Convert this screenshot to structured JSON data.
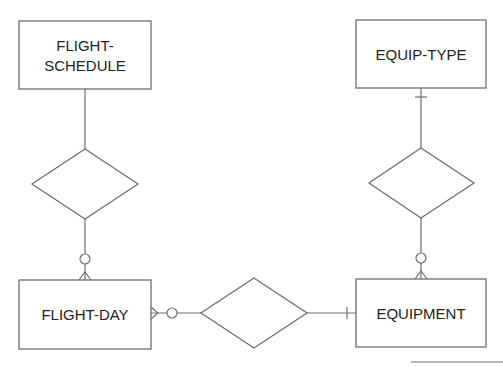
{
  "diagram": {
    "type": "entity-relationship",
    "entities": [
      {
        "id": "flight-schedule",
        "lines": [
          "FLIGHT-",
          "SCHEDULE"
        ]
      },
      {
        "id": "equip-type",
        "lines": [
          "EQUIP-TYPE"
        ]
      },
      {
        "id": "flight-day",
        "lines": [
          "FLIGHT-DAY"
        ]
      },
      {
        "id": "equipment",
        "lines": [
          "EQUIPMENT"
        ]
      }
    ],
    "relationships": [
      {
        "id": "rel-schedule-day",
        "between": [
          "FLIGHT-SCHEDULE",
          "FLIGHT-DAY"
        ],
        "label": ""
      },
      {
        "id": "rel-type-equipment",
        "between": [
          "EQUIP-TYPE",
          "EQUIPMENT"
        ],
        "label": ""
      },
      {
        "id": "rel-day-equipment",
        "between": [
          "FLIGHT-DAY",
          "EQUIPMENT"
        ],
        "label": ""
      }
    ],
    "cardinality": [
      {
        "edge": "FLIGHT-SCHEDULE to FLIGHT-DAY",
        "near_flight_day": "zero-or-many"
      },
      {
        "edge": "EQUIP-TYPE to EQUIPMENT",
        "near_equip_type": "one",
        "near_equipment": "zero-or-many"
      },
      {
        "edge": "FLIGHT-DAY to EQUIPMENT",
        "near_flight_day": "zero-or-many",
        "near_equipment": "one"
      }
    ],
    "colors": {
      "line": "#6f6f6f",
      "text": "#222222",
      "background": "#ffffff"
    }
  }
}
